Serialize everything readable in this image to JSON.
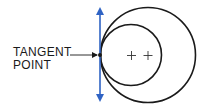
{
  "diagram": {
    "label": {
      "line1": "TANGENT",
      "line2": "POINT"
    },
    "colors": {
      "circle_stroke": "#1a1a1a",
      "tangent_line": "#2f63c4",
      "text": "#1a1a1a",
      "background": "#ffffff"
    },
    "tangent_line": {
      "x": 100,
      "y_top": 7,
      "y_bottom": 102,
      "arrows": "both"
    },
    "tangent_point": {
      "x": 100,
      "y": 55
    },
    "leader": {
      "x1": 70,
      "y1": 55,
      "x2": 98,
      "y2": 55
    },
    "small_circle": {
      "cx": 131,
      "cy": 55,
      "r": 31,
      "center_mark": "+"
    },
    "large_circle": {
      "cx": 148,
      "cy": 55,
      "r": 48,
      "center_mark": "+"
    }
  }
}
